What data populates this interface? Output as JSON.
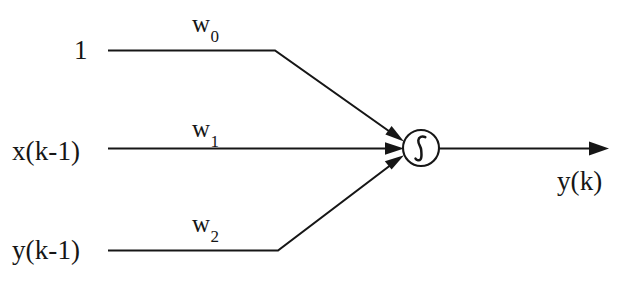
{
  "diagram": {
    "background_color": "#ffffff",
    "stroke_color": "#161616",
    "inputs": [
      {
        "id": "bias",
        "label": "1",
        "weight_label": "w",
        "weight_subscript": "0"
      },
      {
        "id": "x_k_1",
        "label": "x(k-1)",
        "weight_label": "w",
        "weight_subscript": "1"
      },
      {
        "id": "y_k_1",
        "label": "y(k-1)",
        "weight_label": "w",
        "weight_subscript": "2"
      }
    ],
    "node": {
      "id": "activation-node",
      "symbol": "∫",
      "symbol_name": "sigmoid-activation-symbol",
      "center_x": 421,
      "center_y": 148,
      "radius": 18
    },
    "output": {
      "id": "y_k",
      "label": "y(k)"
    }
  }
}
